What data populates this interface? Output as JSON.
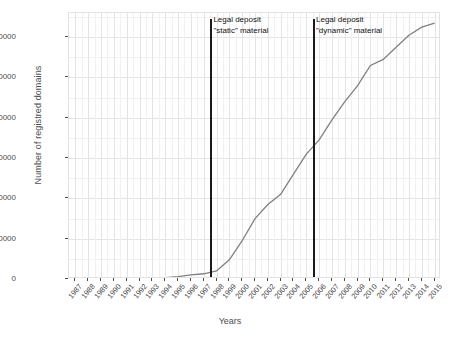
{
  "chart_data": {
    "type": "line",
    "title": "",
    "xlabel": "Years",
    "ylabel": "Number of registred domains",
    "grid": true,
    "legend": null,
    "line_color": "#808080",
    "xlim": [
      1986.5,
      2015.5
    ],
    "ylim": [
      0,
      1320000
    ],
    "y_ticks": [
      0,
      200000,
      400000,
      600000,
      800000,
      1000000,
      1200000
    ],
    "y_tick_labels": [
      "0",
      "200000",
      "400000",
      "600000",
      "800000",
      "1000000",
      "1200000"
    ],
    "categories": [
      "1987",
      "1988",
      "1989",
      "1990",
      "1991",
      "1992",
      "1993",
      "1994",
      "1995",
      "1996",
      "1997",
      "1998",
      "1999",
      "2000",
      "2001",
      "2002",
      "2003",
      "2004",
      "2005",
      "2006",
      "2007",
      "2008",
      "2009",
      "2010",
      "2011",
      "2012",
      "2013",
      "2014",
      "2015"
    ],
    "values": [
      500,
      700,
      1000,
      1500,
      2000,
      3000,
      4500,
      7000,
      12000,
      20000,
      26000,
      40000,
      95000,
      190000,
      300000,
      370000,
      420000,
      520000,
      620000,
      690000,
      790000,
      880000,
      960000,
      1060000,
      1090000,
      1150000,
      1210000,
      1250000,
      1270000
    ],
    "annotations": [
      {
        "name": "legal-deposit-static",
        "line1": "Legal deposit",
        "line2": "\"static\" material",
        "x_value": 1997.6
      },
      {
        "name": "legal-deposit-dynamic",
        "line1": "Legal deposit",
        "line2": "\"dynamic\" material",
        "x_value": 2005.6
      }
    ]
  }
}
